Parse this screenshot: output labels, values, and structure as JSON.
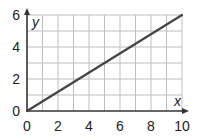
{
  "chart_data": {
    "type": "line",
    "title": "",
    "xlabel": "x",
    "ylabel": "y",
    "xlim": [
      0,
      10
    ],
    "ylim": [
      0,
      6
    ],
    "grid": true,
    "grid_step": {
      "x": 1,
      "y": 1
    },
    "x_ticks": [
      0,
      2,
      4,
      6,
      8,
      10
    ],
    "y_ticks": [
      0,
      2,
      4,
      6
    ],
    "legend": null,
    "series": [
      {
        "name": "line",
        "x": [
          0,
          10
        ],
        "y": [
          0,
          6
        ],
        "color": "#444444"
      }
    ]
  },
  "colors": {
    "grid": "#bdbdbd",
    "axis": "#333333",
    "line": "#444444"
  }
}
